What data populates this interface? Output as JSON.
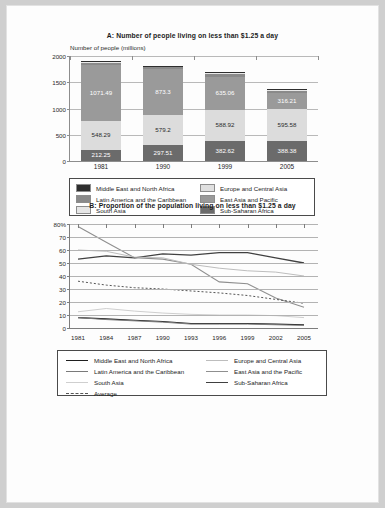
{
  "chart_data": [
    {
      "type": "bar",
      "id": "panel-a",
      "title": "A: Number of people living on less than $1.25 a day",
      "ylabel": "Number of people (millions)",
      "xlabel": "",
      "categories": [
        "1981",
        "1990",
        "1999",
        "2005"
      ],
      "ylim": [
        0,
        2000
      ],
      "yticks": [
        0,
        500,
        1000,
        1500,
        2000
      ],
      "grid": true,
      "stacked": true,
      "series": [
        {
          "name": "Sub-Saharan Africa",
          "color": "#6b6b6b",
          "labelled": true,
          "values": [
            212.25,
            297.51,
            382.62,
            388.38
          ],
          "labels": [
            "212.25",
            "297.51",
            "382.62",
            "388.38"
          ]
        },
        {
          "name": "South Asia",
          "color": "#dcdcdc",
          "labelled": true,
          "values": [
            548.29,
            579.2,
            588.92,
            595.58
          ],
          "labels": [
            "548.29",
            "579.2",
            "588.92",
            "595.58"
          ]
        },
        {
          "name": "East Asia and Pacific",
          "color": "#9a9a9a",
          "labelled": true,
          "values": [
            1071.49,
            873.3,
            635.06,
            316.21
          ],
          "labels": [
            "1071.49",
            "873.3",
            "635.06",
            "316.21"
          ]
        },
        {
          "name": "Latin America and the Caribbean",
          "color": "#8a8a8a",
          "labelled": false,
          "values": [
            42,
            45,
            52,
            45
          ],
          "labels": [
            "",
            "",
            "",
            ""
          ]
        },
        {
          "name": "Europe and Central Asia",
          "color": "#e8e8e8",
          "labelled": false,
          "values": [
            8,
            9,
            18,
            16
          ],
          "labels": [
            "",
            "",
            "",
            ""
          ]
        },
        {
          "name": "Middle East and North Africa",
          "color": "#2e2e2e",
          "labelled": false,
          "values": [
            14,
            12,
            12,
            11
          ],
          "labels": [
            "",
            "",
            "",
            ""
          ]
        }
      ],
      "legend": {
        "position": "below",
        "columns": [
          [
            {
              "label": "Middle East and North Africa",
              "color": "#2e2e2e"
            },
            {
              "label": "Latin America and the Caribbean",
              "color": "#8a8a8a"
            },
            {
              "label": "South Asia",
              "color": "#e6e6e6"
            }
          ],
          [
            {
              "label": "Europe and Central Asia",
              "color": "#e0e0e0"
            },
            {
              "label": "East Asia and Pacific",
              "color": "#9a9a9a"
            },
            {
              "label": "Sub-Saharan Africa",
              "color": "#6b6b6b"
            }
          ]
        ]
      }
    },
    {
      "type": "line",
      "id": "panel-b",
      "title": "B: Proportion of the population living on less than $1.25 a day",
      "ylabel": "",
      "xlabel": "",
      "x": [
        "1981",
        "1984",
        "1987",
        "1990",
        "1993",
        "1996",
        "1999",
        "2002",
        "2005"
      ],
      "ylim": [
        0,
        80
      ],
      "yticks": [
        0,
        10,
        20,
        30,
        40,
        50,
        60,
        70,
        80
      ],
      "ytick_labels": [
        "0",
        "10",
        "20",
        "30",
        "40",
        "50",
        "60",
        "70",
        "80%"
      ],
      "grid": true,
      "series": [
        {
          "name": "East Asia and the Pacific",
          "color": "#8f8f8f",
          "width": 1.1,
          "dash": "",
          "values": [
            78,
            66,
            54,
            53,
            49,
            35.5,
            34,
            23,
            16
          ]
        },
        {
          "name": "Sub-Saharan Africa",
          "color": "#404040",
          "width": 1.3,
          "dash": "",
          "values": [
            53,
            55.5,
            54,
            57,
            56,
            58,
            58,
            54,
            50
          ]
        },
        {
          "name": "Europe and Central Asia",
          "color": "#bdbdbd",
          "width": 1.0,
          "dash": "",
          "values": [
            60,
            59,
            54.5,
            54,
            49,
            46,
            44,
            43,
            40
          ]
        },
        {
          "name": "Average",
          "color": "#555555",
          "width": 1.0,
          "dash": "2,2",
          "values": [
            36,
            33,
            31,
            30,
            28.5,
            27,
            25,
            22,
            19
          ]
        },
        {
          "name": "South Asia",
          "color": "#cfcfcf",
          "width": 1.0,
          "dash": "",
          "values": [
            12.5,
            15,
            13,
            11.5,
            10.5,
            10,
            10,
            9.5,
            8
          ]
        },
        {
          "name": "Middle East and North Africa",
          "color": "#1f1f1f",
          "width": 1.1,
          "dash": "",
          "values": [
            8,
            7,
            6,
            5,
            3.5,
            3.5,
            3.5,
            3,
            2.5
          ]
        },
        {
          "name": "Latin America and the Caribbean",
          "color": "#7a7a7a",
          "width": 1.0,
          "dash": "",
          "values": [
            8,
            6.5,
            5.5,
            4.5,
            3,
            3,
            3,
            2.5,
            2
          ]
        }
      ],
      "legend": {
        "position": "below",
        "columns": [
          [
            {
              "label": "Middle East and North Africa",
              "color": "#1f1f1f",
              "dash": "",
              "width": 1.6
            },
            {
              "label": "Latin America and the Caribbean",
              "color": "#7a7a7a",
              "dash": "",
              "width": 1.0
            },
            {
              "label": "South Asia",
              "color": "#cfcfcf",
              "dash": "",
              "width": 1.0
            },
            {
              "label": "Average",
              "color": "#555555",
              "dash": "2,2",
              "width": 1.0
            }
          ],
          [
            {
              "label": "Europe and Central Asia",
              "color": "#bdbdbd",
              "dash": "",
              "width": 1.0
            },
            {
              "label": "East Asia and the Pacific",
              "color": "#8f8f8f",
              "dash": "",
              "width": 1.1
            },
            {
              "label": "Sub-Saharan Africa",
              "color": "#404040",
              "dash": "",
              "width": 1.6
            }
          ]
        ]
      }
    }
  ]
}
